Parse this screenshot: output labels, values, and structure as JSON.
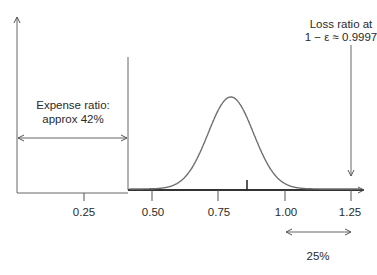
{
  "chart_data": {
    "type": "line",
    "title": "",
    "xlabel": "",
    "ylabel": "",
    "x_ticks": [
      0.25,
      0.5,
      0.75,
      1.0,
      1.25
    ],
    "x_tick_labels": [
      "0.25",
      "0.50",
      "0.75",
      "1.00",
      "1.25"
    ],
    "xlim": [
      0.0,
      1.29
    ],
    "grid": false,
    "legend": null,
    "series": [
      {
        "name": "Loss ratio density",
        "distribution": "approx normal",
        "support_start": 0.42,
        "mean": 0.8,
        "peak_x": 0.8,
        "std_approx": 0.085,
        "color": "#6f6f6f"
      }
    ],
    "markers": [
      {
        "name": "Expense ratio boundary",
        "x": 0.42
      },
      {
        "name": "Small tick on baseline",
        "x": 0.87
      },
      {
        "name": "Loss ratio at 1 - ε ≈ 0.9997",
        "x": 1.25
      }
    ],
    "annotations": [
      {
        "text": "Expense ratio:\napprox 42%",
        "span": [
          0.0,
          0.42
        ]
      },
      {
        "text": "Loss ratio at\n1 − ε ≈ 0.9997",
        "x": 1.25
      },
      {
        "text": "25%",
        "span": [
          1.0,
          1.25
        ]
      }
    ]
  },
  "labels": {
    "ticks": [
      "0.25",
      "0.50",
      "0.75",
      "1.00",
      "1.25"
    ],
    "expense_line1": "Expense ratio:",
    "expense_line2": "approx 42%",
    "loss_line1": "Loss ratio at",
    "loss_line2": "1 − ε ≈ 0.9997",
    "span_pct": "25%"
  },
  "colors": {
    "axis": "#555555",
    "curve": "#6f6f6f",
    "baseline": "#333333",
    "text": "#2a2a2a"
  }
}
